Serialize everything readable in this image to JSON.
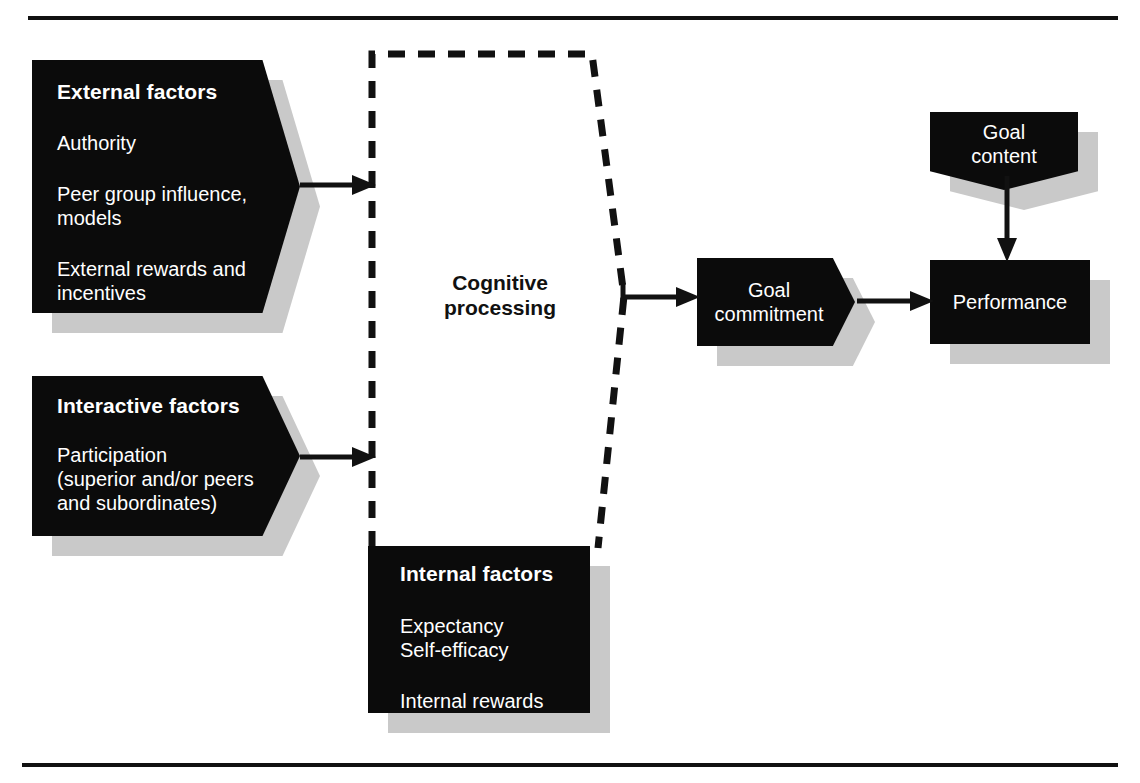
{
  "diagram": {
    "colors": {
      "box_fill": "#0b0b0b",
      "box_text": "#ffffff",
      "shadow": "#c9c9c9",
      "line": "#111111",
      "background": "#ffffff"
    },
    "nodes": {
      "external_factors": {
        "heading": "External factors",
        "items": [
          "Authority",
          "Peer group influence,\nmodels",
          "External rewards and\nincentives"
        ],
        "shape": "pentagon-right"
      },
      "interactive_factors": {
        "heading": "Interactive factors",
        "items": [
          "Participation\n(superior and/or peers\nand subordinates)"
        ],
        "shape": "pentagon-right"
      },
      "internal_factors": {
        "heading": "Internal factors",
        "items": [
          "Expectancy",
          "Self-efficacy",
          "Internal rewards"
        ],
        "shape": "rectangle"
      },
      "cognitive_processing": {
        "label": "Cognitive\nprocessing",
        "shape": "dashed-region"
      },
      "goal_commitment": {
        "label": "Goal\ncommitment",
        "shape": "pentagon-right"
      },
      "goal_content": {
        "label": "Goal\ncontent",
        "shape": "pentagon-down"
      },
      "performance": {
        "label": "Performance",
        "shape": "rectangle"
      }
    },
    "edges": [
      {
        "from": "external_factors",
        "to": "cognitive_processing",
        "style": "solid-arrow"
      },
      {
        "from": "interactive_factors",
        "to": "cognitive_processing",
        "style": "solid-arrow"
      },
      {
        "from": "cognitive_processing",
        "to": "goal_commitment",
        "style": "solid-arrow"
      },
      {
        "from": "goal_commitment",
        "to": "performance",
        "style": "solid-arrow"
      },
      {
        "from": "goal_content",
        "to": "performance",
        "style": "solid-arrow"
      }
    ]
  }
}
